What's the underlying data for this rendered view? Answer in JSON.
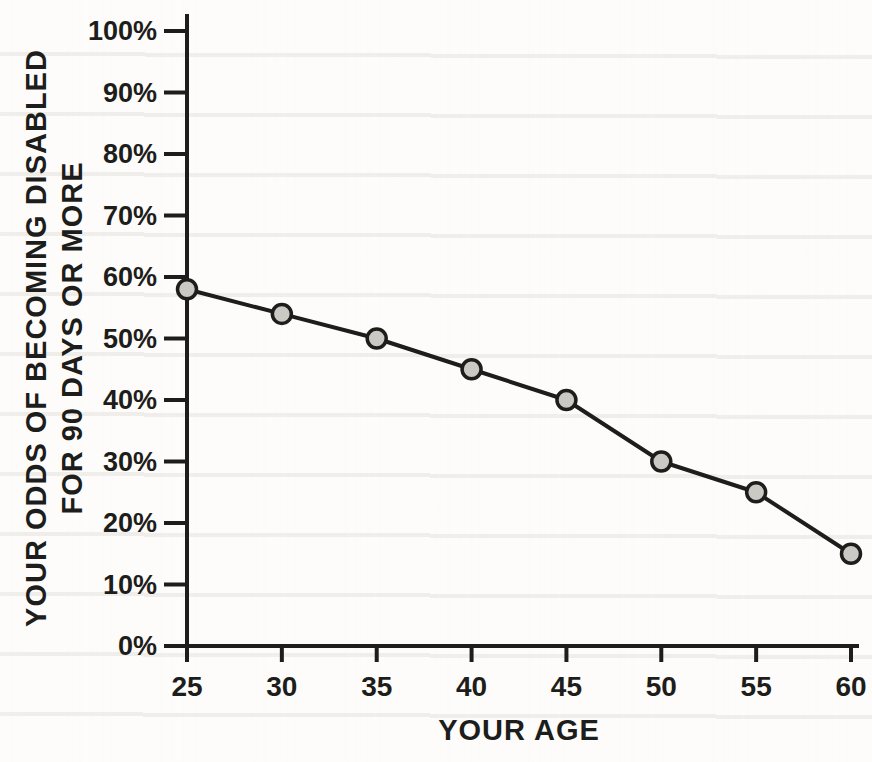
{
  "chart_data": {
    "type": "line",
    "title": "",
    "xlabel": "YOUR AGE",
    "ylabel_line1": "YOUR ODDS OF BECOMING DISABLED",
    "ylabel_line2": "FOR 90 DAYS OR MORE",
    "series_name": "odds-of-becoming-disabled",
    "x": [
      25,
      30,
      35,
      40,
      45,
      50,
      55,
      60
    ],
    "values": [
      58,
      54,
      50,
      45,
      40,
      30,
      25,
      15
    ],
    "xlim": [
      25,
      60
    ],
    "ylim": [
      0,
      100
    ],
    "x_tick_step": 5,
    "y_tick_step": 10,
    "y_tick_suffix": "%",
    "x_tick_labels": [
      "25",
      "30",
      "35",
      "40",
      "45",
      "50",
      "55",
      "60"
    ],
    "y_tick_labels": [
      "0%",
      "10%",
      "20%",
      "30%",
      "40%",
      "50%",
      "60%",
      "70%",
      "80%",
      "90%",
      "100%"
    ],
    "grid": false,
    "legend": "none",
    "colors": {
      "line": "#1d1d1b",
      "marker_fill": "#cac9c4",
      "marker_stroke": "#1d1d1b",
      "text": "#1d1d1b",
      "paper": "#fdfcfa"
    }
  }
}
